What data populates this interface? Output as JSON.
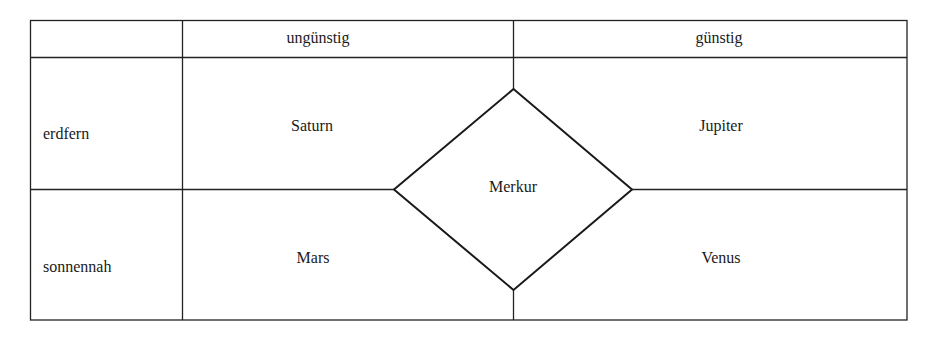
{
  "table": {
    "header": {
      "corner": "",
      "col_unfavorable": "ungünstig",
      "col_favorable": "günstig"
    },
    "rows": [
      {
        "label": "erdfern",
        "unfavorable": "Saturn",
        "favorable": "Jupiter"
      },
      {
        "label": "sonnennah",
        "unfavorable": "Mars",
        "favorable": "Venus"
      }
    ],
    "center": "Merkur"
  },
  "colors": {
    "line": "#222222",
    "text": "#1a1a1a",
    "background": "#ffffff"
  }
}
